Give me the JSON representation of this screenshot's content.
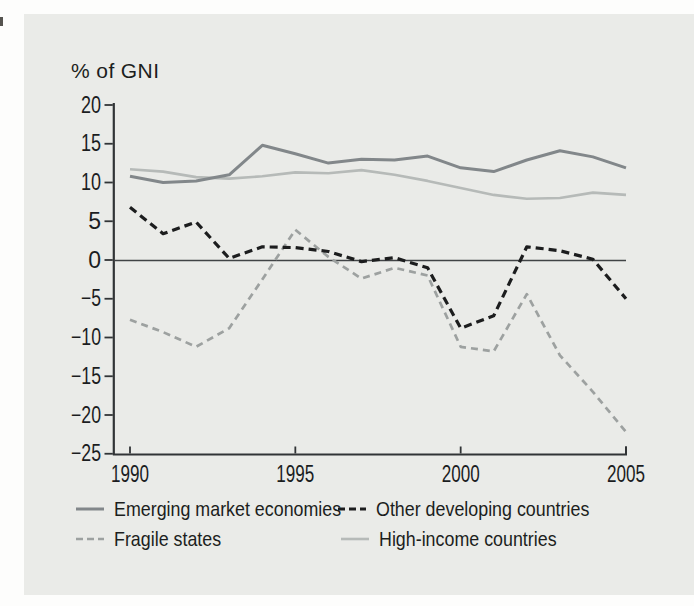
{
  "panel": {
    "background": "#eaebe8"
  },
  "chart_data": {
    "type": "line",
    "title": "",
    "ylabel": "% of GNI",
    "xlabel": "",
    "xlim": [
      1990,
      2005
    ],
    "ylim": [
      -25,
      20
    ],
    "grid": false,
    "zero_line": true,
    "legend_position": "bottom",
    "x": [
      1990,
      1991,
      1992,
      1993,
      1994,
      1995,
      1996,
      1997,
      1998,
      1999,
      2000,
      2001,
      2002,
      2003,
      2004,
      2005
    ],
    "xticks": [
      {
        "label": "1990",
        "value": 1990
      },
      {
        "label": "1995",
        "value": 1995
      },
      {
        "label": "2000",
        "value": 2000
      },
      {
        "label": "2005",
        "value": 2005
      }
    ],
    "yticks": [
      {
        "label": "20",
        "value": 20
      },
      {
        "label": "15",
        "value": 15
      },
      {
        "label": "10",
        "value": 10
      },
      {
        "label": "5",
        "value": 5
      },
      {
        "label": "0",
        "value": 0
      },
      {
        "label": "−5",
        "value": -5
      },
      {
        "label": "−10",
        "value": -10
      },
      {
        "label": "−15",
        "value": -15
      },
      {
        "label": "−20",
        "value": -20
      },
      {
        "label": "−25",
        "value": -25
      }
    ],
    "series": [
      {
        "name": "Emerging market economies",
        "style": "solid",
        "color": "#82878a",
        "width": 3,
        "values": [
          10.8,
          10.0,
          10.2,
          11.0,
          14.8,
          13.7,
          12.5,
          13.0,
          12.9,
          13.4,
          11.9,
          11.4,
          12.9,
          14.1,
          13.3,
          11.9
        ]
      },
      {
        "name": "Other developing countries",
        "style": "dashed",
        "color": "#1c1d1e",
        "width": 3.2,
        "values": [
          6.8,
          3.4,
          4.9,
          0.2,
          1.7,
          1.6,
          1.1,
          -0.2,
          0.3,
          -1.0,
          -8.8,
          -7.2,
          1.7,
          1.2,
          0.1,
          -5.0
        ]
      },
      {
        "name": "Fragile states",
        "style": "dashed",
        "color": "#9da1a0",
        "width": 2.7,
        "values": [
          -7.7,
          -9.3,
          -11.2,
          -8.8,
          -2.5,
          3.9,
          0.4,
          -2.4,
          -1.0,
          -2.0,
          -11.2,
          -11.8,
          -4.4,
          -12.3,
          -17.0,
          -22.2
        ]
      },
      {
        "name": "High-income countries",
        "style": "solid",
        "color": "#b6bab8",
        "width": 2.6,
        "values": [
          11.7,
          11.4,
          10.7,
          10.5,
          10.8,
          11.3,
          11.2,
          11.6,
          11.0,
          10.2,
          9.3,
          8.4,
          7.9,
          8.0,
          8.7,
          8.4
        ]
      }
    ],
    "legend_layout": [
      {
        "series_index": 0,
        "left": 75,
        "top": 497
      },
      {
        "series_index": 1,
        "left": 337,
        "top": 497
      },
      {
        "series_index": 2,
        "left": 75,
        "top": 527
      },
      {
        "series_index": 3,
        "left": 340,
        "top": 527
      }
    ]
  }
}
